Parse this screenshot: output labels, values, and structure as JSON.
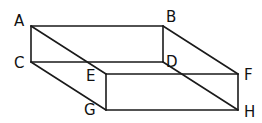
{
  "diagram": {
    "type": "cuboid-wireframe",
    "stroke_color": "#1a1a1a",
    "background": "#ffffff",
    "vertices": {
      "A": {
        "label": "A",
        "x": 31,
        "y": 26
      },
      "B": {
        "label": "B",
        "x": 163,
        "y": 26
      },
      "C": {
        "label": "C",
        "x": 31,
        "y": 62
      },
      "D": {
        "label": "D",
        "x": 163,
        "y": 62
      },
      "E": {
        "label": "E",
        "x": 106,
        "y": 74
      },
      "F": {
        "label": "F",
        "x": 238,
        "y": 74
      },
      "G": {
        "label": "G",
        "x": 106,
        "y": 110
      },
      "H": {
        "label": "H",
        "x": 238,
        "y": 110
      }
    },
    "edges": [
      [
        "A",
        "B"
      ],
      [
        "A",
        "C"
      ],
      [
        "B",
        "D"
      ],
      [
        "C",
        "D"
      ],
      [
        "E",
        "F"
      ],
      [
        "F",
        "H"
      ],
      [
        "H",
        "G"
      ],
      [
        "G",
        "E"
      ],
      [
        "A",
        "E"
      ],
      [
        "B",
        "F"
      ],
      [
        "C",
        "G"
      ],
      [
        "D",
        "H"
      ]
    ]
  }
}
